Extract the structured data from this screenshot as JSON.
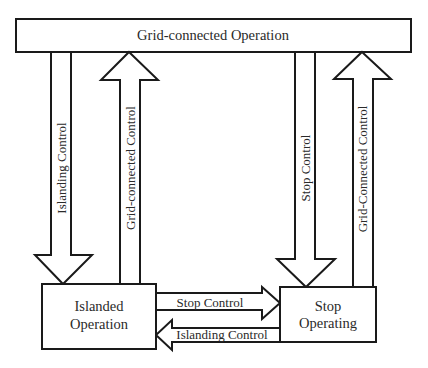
{
  "diagram": {
    "type": "state-transition",
    "colors": {
      "stroke": "#1a1a1a",
      "fill": "#ffffff",
      "text": "#2a2a2a"
    },
    "states": {
      "grid": {
        "label": "Grid-connected Operation"
      },
      "islanded": {
        "line1": "Islanded",
        "line2": "Operation"
      },
      "stop": {
        "line1": "Stop",
        "line2": "Operating"
      }
    },
    "transitions": {
      "grid_to_islanded": {
        "label": "Islanding Control",
        "from": "Grid-connected Operation",
        "to": "Islanded Operation"
      },
      "islanded_to_grid": {
        "label": "Grid-connected Control",
        "from": "Islanded Operation",
        "to": "Grid-connected Operation"
      },
      "grid_to_stop": {
        "label": "Stop Control",
        "from": "Grid-connected Operation",
        "to": "Stop Operating"
      },
      "stop_to_grid": {
        "label": "Grid-Connected Control",
        "from": "Stop Operating",
        "to": "Grid-connected Operation"
      },
      "islanded_to_stop": {
        "label": "Stop Control",
        "from": "Islanded Operation",
        "to": "Stop Operating"
      },
      "stop_to_islanded": {
        "label": "Islanding Control",
        "from": "Stop Operating",
        "to": "Islanded Operation"
      }
    }
  }
}
